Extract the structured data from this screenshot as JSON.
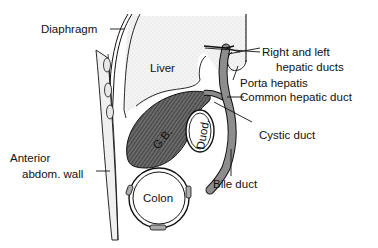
{
  "diagram": {
    "type": "anatomical-cross-section",
    "colors": {
      "ink": "#111111",
      "liver_fill": "#ececec",
      "gallbladder_fill": "#5a5a5a",
      "duct_fill": "#8a8a8a",
      "wall_fill": "#f2f2f2",
      "background": "#ffffff"
    },
    "organ_labels": {
      "liver": "Liver",
      "gallbladder": "G.B.",
      "duodenum": "Duod.",
      "colon": "Colon"
    },
    "callouts": [
      {
        "id": "diaphragm",
        "text": "Diaphragm"
      },
      {
        "id": "right-left-hepatic-ducts",
        "lines": [
          "Right and left",
          "hepatic ducts"
        ]
      },
      {
        "id": "porta-hepatis",
        "text": "Porta hepatis"
      },
      {
        "id": "common-hepatic-duct",
        "text": "Common hepatic duct"
      },
      {
        "id": "cystic-duct",
        "text": "Cystic duct"
      },
      {
        "id": "anterior-abdominal-wall",
        "lines": [
          "Anterior",
          "abdom. wall"
        ]
      },
      {
        "id": "bile-duct",
        "text": "Bile duct"
      }
    ]
  }
}
